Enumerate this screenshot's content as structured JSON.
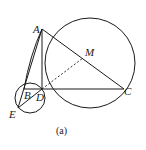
{
  "diagram": {
    "points": {
      "A": "A",
      "B": "B",
      "C": "C",
      "D": "D",
      "E": "E",
      "M": "M"
    },
    "caption": "(a)",
    "colors": {
      "stroke": "#1a1a1a",
      "background": "#ffffff"
    }
  }
}
